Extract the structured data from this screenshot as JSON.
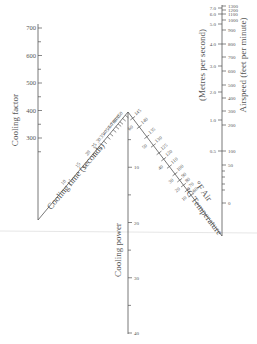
{
  "nomogram": {
    "cooling_factor": {
      "title": "Cooling factor",
      "ticks": [
        {
          "label": "700",
          "v": 700
        },
        {
          "label": "600",
          "v": 600
        },
        {
          "label": "500",
          "v": 500
        },
        {
          "label": "400",
          "v": 400
        },
        {
          "label": "300",
          "v": 300
        }
      ],
      "minor": [
        650,
        550,
        450,
        350,
        250
      ]
    },
    "cooling_time": {
      "title": "Cooling time (seconds)",
      "ticks": [
        {
          "label": "150"
        },
        {
          "label": "100"
        },
        {
          "label": "80"
        },
        {
          "label": "70"
        },
        {
          "label": "60"
        },
        {
          "label": "50"
        },
        {
          "label": "40"
        },
        {
          "label": "35"
        },
        {
          "label": "30"
        },
        {
          "label": "25"
        },
        {
          "label": "20"
        },
        {
          "label": "15"
        },
        {
          "label": "10"
        }
      ]
    },
    "cooling_power": {
      "title": "Cooling power",
      "ticks": [
        {
          "label": "10",
          "v": 10
        },
        {
          "label": "20",
          "v": 20
        },
        {
          "label": "30",
          "v": 30
        },
        {
          "label": "40",
          "v": 40
        }
      ]
    },
    "temperature": {
      "title_f": "°F Air",
      "title_c": "°C Temperature",
      "f_ticks": [
        "145",
        "140",
        "135",
        "130",
        "125",
        "120",
        "110",
        "100",
        "90",
        "80",
        "70",
        "60"
      ],
      "c_ticks": [
        "60",
        "50",
        "40",
        "30",
        "20",
        "10"
      ]
    },
    "airspeed": {
      "title_ms": "(Metres per second)",
      "title_fpm": "Airspeed (feet per minute)",
      "ms_ticks": [
        {
          "label": "7.0",
          "v": 7.0
        },
        {
          "label": "6.0",
          "v": 6.0
        },
        {
          "label": "5.0",
          "v": 5.0
        },
        {
          "label": "4.0",
          "v": 4.0
        },
        {
          "label": "3.0",
          "v": 3.0
        },
        {
          "label": "2.0",
          "v": 2.0
        },
        {
          "label": "1.0",
          "v": 1.0
        },
        {
          "label": "0.5",
          "v": 0.5
        }
      ],
      "fpm_ticks": [
        {
          "label": "1300"
        },
        {
          "label": "1200"
        },
        {
          "label": "1100"
        },
        {
          "label": "1000"
        },
        {
          "label": "900"
        },
        {
          "label": "800"
        },
        {
          "label": "700"
        },
        {
          "label": "600"
        },
        {
          "label": "500"
        },
        {
          "label": "400"
        },
        {
          "label": "300"
        },
        {
          "label": "200"
        },
        {
          "label": "100"
        },
        {
          "label": "50"
        },
        {
          "label": "0"
        }
      ]
    }
  }
}
